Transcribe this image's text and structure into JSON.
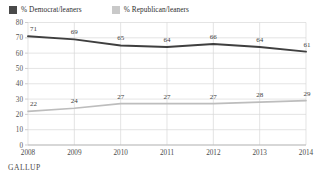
{
  "legend": {
    "position": "top-left",
    "entries": [
      {
        "label": "% Democrat/leaners",
        "color": "#4a4a4a",
        "swatch_name": "democrat-swatch"
      },
      {
        "label": "% Republican/leaners",
        "color": "#c9c9c9",
        "swatch_name": "republican-swatch"
      }
    ]
  },
  "footer": {
    "source": "GALLUP"
  },
  "chart_data": {
    "type": "line",
    "title": "",
    "subtitle": "",
    "xlabel": "",
    "ylabel": "",
    "categories": [
      "2008",
      "2009",
      "2010",
      "2011",
      "2012",
      "2013",
      "2014"
    ],
    "x": [
      2008,
      2009,
      2010,
      2011,
      2012,
      2013,
      2014
    ],
    "ylim": [
      0,
      80
    ],
    "yticks": [
      0,
      10,
      20,
      30,
      40,
      50,
      60,
      70,
      80
    ],
    "ytick_labels": [
      "0",
      "10",
      "20",
      "30",
      "40",
      "50",
      "60",
      "70",
      "80"
    ],
    "grid": true,
    "grid_axis": "both",
    "legend_position": "top-left",
    "data_labels": true,
    "series": [
      {
        "name": "% Democrat/leaners",
        "color": "#3f3f3f",
        "values": [
          71,
          69,
          65,
          64,
          66,
          64,
          61
        ],
        "labels": [
          "71",
          "69",
          "65",
          "64",
          "66",
          "64",
          "61"
        ]
      },
      {
        "name": "% Republican/leaners",
        "color": "#bdbdbd",
        "values": [
          22,
          24,
          27,
          27,
          27,
          28,
          29
        ],
        "labels": [
          "22",
          "24",
          "27",
          "27",
          "27",
          "28",
          "29"
        ]
      }
    ]
  }
}
